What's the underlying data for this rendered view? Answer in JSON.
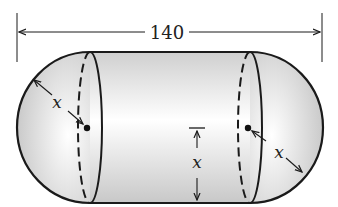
{
  "figure": {
    "type": "capsule-diagram",
    "overall_length_label": "140",
    "radius_label_left": "x",
    "radius_label_center": "x",
    "radius_label_right": "x",
    "colors": {
      "outline": "#1a1a1a",
      "fill_light": "#ffffff",
      "fill_shade": "#d0d0d0"
    }
  }
}
